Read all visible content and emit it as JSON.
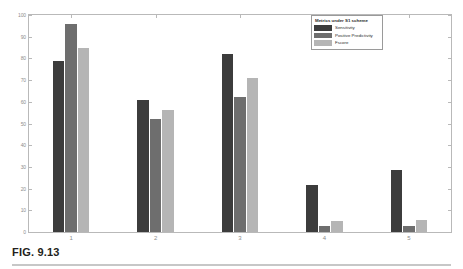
{
  "figure": {
    "caption": "FIG. 9.13"
  },
  "legend": {
    "title": "Metrics under S1 scheme",
    "entries": [
      {
        "label": "Sensitivity",
        "color": "#3c3c3c"
      },
      {
        "label": "Positive Predictivity",
        "color": "#6e6e6e"
      },
      {
        "label": "Fscore",
        "color": "#b5b5b5"
      }
    ]
  },
  "chart_data": {
    "type": "bar",
    "title": "",
    "xlabel": "",
    "ylabel": "",
    "categories": [
      "1",
      "2",
      "3",
      "4",
      "5"
    ],
    "ylim": [
      0,
      100
    ],
    "yticks": [
      0,
      10,
      20,
      30,
      40,
      50,
      60,
      70,
      80,
      90,
      100
    ],
    "grid": false,
    "legend_position": "top-right",
    "series": [
      {
        "name": "Sensitivity",
        "color": "#3c3c3c",
        "values": [
          79,
          61,
          82,
          21.5,
          28.5
        ]
      },
      {
        "name": "Positive Predictivity",
        "color": "#6e6e6e",
        "values": [
          96,
          52,
          62,
          3,
          3
        ]
      },
      {
        "name": "Fscore",
        "color": "#b5b5b5",
        "values": [
          85,
          56,
          71,
          5,
          5.5
        ]
      }
    ]
  }
}
